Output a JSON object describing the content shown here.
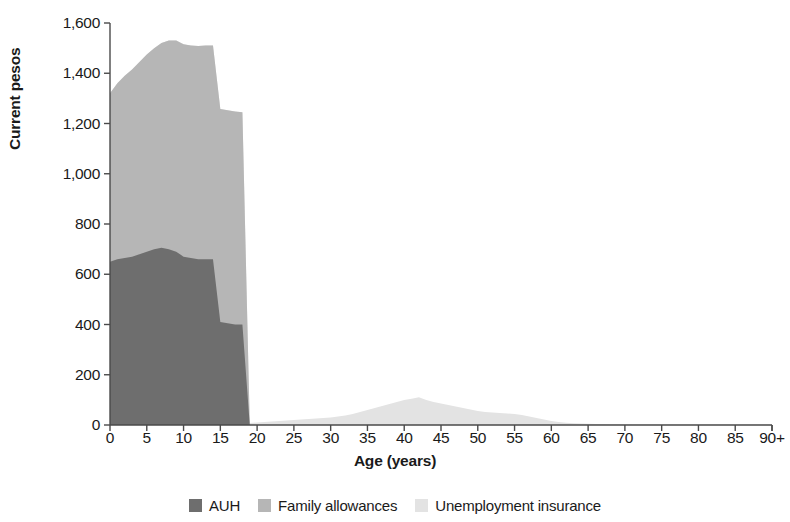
{
  "chart_data": {
    "type": "area",
    "title": "",
    "xlabel": "Age (years)",
    "ylabel": "Current pesos",
    "xlim": [
      0,
      90
    ],
    "ylim": [
      0,
      1600
    ],
    "grid": false,
    "stacked": true,
    "legend_position": "bottom",
    "x_tick_labels": [
      "0",
      "5",
      "10",
      "15",
      "20",
      "25",
      "30",
      "35",
      "40",
      "45",
      "50",
      "55",
      "60",
      "65",
      "70",
      "75",
      "80",
      "85",
      "90+"
    ],
    "x_ticks": [
      0,
      5,
      10,
      15,
      20,
      25,
      30,
      35,
      40,
      45,
      50,
      55,
      60,
      65,
      70,
      75,
      80,
      85,
      90
    ],
    "y_tick_labels": [
      "0",
      "200",
      "400",
      "600",
      "800",
      "1,000",
      "1,200",
      "1,400",
      "1,600"
    ],
    "y_ticks": [
      0,
      200,
      400,
      600,
      800,
      1000,
      1200,
      1400,
      1600
    ],
    "x": [
      0,
      1,
      2,
      3,
      4,
      5,
      6,
      7,
      8,
      9,
      10,
      11,
      12,
      13,
      14,
      15,
      16,
      17,
      18,
      19,
      20,
      21,
      22,
      23,
      24,
      25,
      26,
      27,
      28,
      29,
      30,
      31,
      32,
      33,
      34,
      35,
      36,
      37,
      38,
      39,
      40,
      41,
      42,
      43,
      44,
      45,
      46,
      47,
      48,
      49,
      50,
      51,
      52,
      53,
      54,
      55,
      56,
      57,
      58,
      59,
      60,
      61,
      62,
      63,
      64,
      65,
      66,
      67,
      68,
      69,
      70,
      71,
      72,
      73,
      74,
      75,
      76,
      77,
      78,
      79,
      80,
      81,
      82,
      83,
      84,
      85,
      86,
      87,
      88,
      89,
      90
    ],
    "series": [
      {
        "name": "AUH",
        "color": "#6e6e6e",
        "values": [
          650,
          660,
          665,
          670,
          680,
          690,
          700,
          705,
          700,
          690,
          670,
          665,
          660,
          660,
          660,
          410,
          405,
          400,
          400,
          0,
          0,
          0,
          0,
          0,
          0,
          0,
          0,
          0,
          0,
          0,
          0,
          0,
          0,
          0,
          0,
          0,
          0,
          0,
          0,
          0,
          0,
          0,
          0,
          0,
          0,
          0,
          0,
          0,
          0,
          0,
          0,
          0,
          0,
          0,
          0,
          0,
          0,
          0,
          0,
          0,
          0,
          0,
          0,
          0,
          0,
          0,
          0,
          0,
          0,
          0,
          0,
          0,
          0,
          0,
          0,
          0,
          0,
          0,
          0,
          0,
          0,
          0,
          0,
          0,
          0,
          0,
          0,
          0,
          0,
          0,
          0
        ]
      },
      {
        "name": "Family allowances",
        "color": "#b6b6b6",
        "values": [
          670,
          700,
          725,
          745,
          765,
          785,
          800,
          815,
          830,
          840,
          845,
          845,
          848,
          850,
          850,
          848,
          848,
          848,
          845,
          0,
          0,
          0,
          0,
          0,
          0,
          0,
          0,
          0,
          0,
          0,
          0,
          0,
          0,
          0,
          0,
          0,
          0,
          0,
          0,
          0,
          0,
          0,
          0,
          0,
          0,
          0,
          0,
          0,
          0,
          0,
          0,
          0,
          0,
          0,
          0,
          0,
          0,
          0,
          0,
          0,
          0,
          0,
          0,
          0,
          0,
          0,
          0,
          0,
          0,
          0,
          0,
          0,
          0,
          0,
          0,
          0,
          0,
          0,
          0,
          0,
          0,
          0,
          0,
          0,
          0,
          0,
          0,
          0,
          0,
          0,
          0
        ]
      },
      {
        "name": "Unemployment insurance",
        "color": "#e3e3e3",
        "values": [
          0,
          0,
          0,
          0,
          0,
          0,
          0,
          0,
          0,
          0,
          0,
          0,
          0,
          0,
          0,
          0,
          0,
          0,
          0,
          8,
          10,
          12,
          14,
          16,
          18,
          20,
          22,
          24,
          26,
          28,
          30,
          34,
          38,
          44,
          52,
          60,
          68,
          76,
          84,
          92,
          100,
          104,
          110,
          100,
          92,
          86,
          80,
          74,
          68,
          62,
          56,
          52,
          50,
          48,
          46,
          44,
          40,
          34,
          28,
          22,
          16,
          12,
          9,
          7,
          6,
          5,
          4,
          4,
          3,
          3,
          3,
          2,
          2,
          2,
          2,
          2,
          2,
          1,
          1,
          1,
          1,
          1,
          1,
          1,
          1,
          1,
          1,
          1,
          1,
          1,
          1
        ]
      }
    ]
  },
  "axis": {
    "x_title": "Age (years)",
    "y_title": "Current pesos"
  },
  "legend": {
    "items": [
      {
        "label": "AUH",
        "color": "#6e6e6e"
      },
      {
        "label": "Family allowances",
        "color": "#b6b6b6"
      },
      {
        "label": "Unemployment insurance",
        "color": "#e3e3e3"
      }
    ]
  }
}
